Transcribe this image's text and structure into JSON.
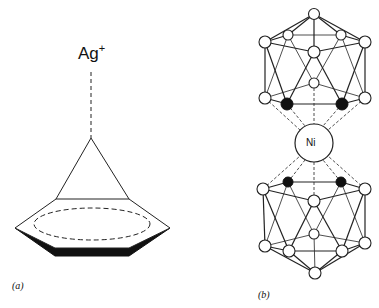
{
  "figure": {
    "panel_a": {
      "ion_label": "Ag",
      "ion_charge": "+",
      "caption": "(a)",
      "description": "Ag+ ion coordinated above a benzene ring (pi complex)"
    },
    "panel_b": {
      "center_label": "Ni",
      "caption": "(b)",
      "description": "Nickel sandwiched between two icosahedral carborane cages; black dots mark carbon atoms"
    }
  },
  "colors": {
    "line": "#222222",
    "fill_dark": "#111111",
    "background": "#ffffff"
  }
}
